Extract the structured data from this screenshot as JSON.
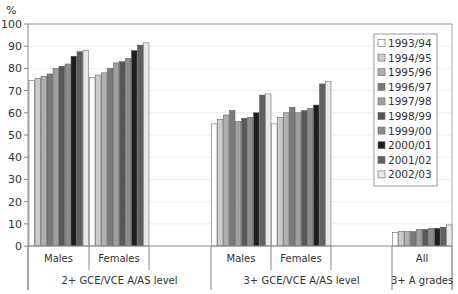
{
  "chart_data": {
    "type": "bar",
    "title": "",
    "ylabel": "%",
    "xlabel": "",
    "ylim": [
      0,
      100
    ],
    "yticks": [
      0,
      10,
      20,
      30,
      40,
      50,
      60,
      70,
      80,
      90,
      100
    ],
    "grid": true,
    "legend_position": "right-inside",
    "groups": [
      {
        "label": "2+ GCE/VCE A/AS level",
        "categories": [
          "Males",
          "Females"
        ]
      },
      {
        "label": "3+ GCE/VCE A/AS level",
        "categories": [
          "Males",
          "Females"
        ]
      },
      {
        "label": "3+ A grades",
        "categories": [
          "All"
        ]
      }
    ],
    "categories": [
      "2+ GCE/VCE A/AS level - Males",
      "2+ GCE/VCE A/AS level - Females",
      "3+ GCE/VCE A/AS level - Males",
      "3+ GCE/VCE A/AS level - Females",
      "3+ A grades - All"
    ],
    "series": [
      {
        "name": "1993/94",
        "color": "#ffffff",
        "values": [
          74.5,
          76,
          55,
          55,
          6
        ]
      },
      {
        "name": "1994/95",
        "color": "#cccccc",
        "values": [
          75.5,
          77,
          57,
          58,
          6.5
        ]
      },
      {
        "name": "1995/96",
        "color": "#b0b0b0",
        "values": [
          76.5,
          78,
          59,
          60,
          6.5
        ]
      },
      {
        "name": "1996/97",
        "color": "#7a7a7a",
        "values": [
          77.5,
          80,
          61,
          62.5,
          6.5
        ]
      },
      {
        "name": "1997/98",
        "color": "#a0a0a0",
        "values": [
          80,
          82.5,
          56,
          60,
          7.5
        ]
      },
      {
        "name": "1998/99",
        "color": "#585858",
        "values": [
          81,
          83,
          57.5,
          61,
          7.5
        ]
      },
      {
        "name": "1999/00",
        "color": "#8c8c8c",
        "values": [
          82,
          84.5,
          58,
          62,
          8
        ]
      },
      {
        "name": "2000/01",
        "color": "#1e1e1e",
        "values": [
          85.5,
          88,
          60,
          63.5,
          8
        ]
      },
      {
        "name": "2001/02",
        "color": "#606060",
        "values": [
          87.5,
          90.5,
          68,
          73,
          8.5
        ]
      },
      {
        "name": "2002/03",
        "color": "#e8e8e8",
        "values": [
          88,
          91.5,
          68.5,
          74,
          9.5
        ]
      }
    ]
  }
}
